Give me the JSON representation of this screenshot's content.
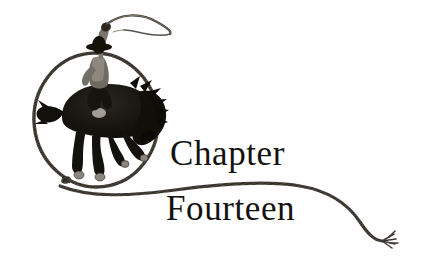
{
  "page": {
    "width": 433,
    "height": 271,
    "background_color": "#ffffff",
    "ink_color": "#14120f",
    "rope_color": "#4a4540"
  },
  "heading": {
    "line1": "Chapter",
    "line2": "Fourteen",
    "full_text": "Chapter Fourteen"
  },
  "illustration": {
    "name": "cowboy-bucking-bronco-lasso",
    "elements": [
      "cowboy-rider",
      "cowboy-hat",
      "raised-arm-with-rope",
      "bucking-horse",
      "saddle",
      "lasso-loop",
      "rope-knot-honda",
      "trailing-rope",
      "frayed-rope-end"
    ]
  }
}
